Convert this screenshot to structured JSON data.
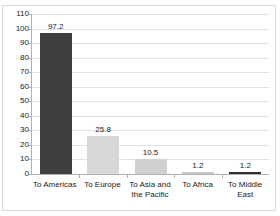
{
  "chart_data": {
    "type": "bar",
    "title": "",
    "xlabel": "",
    "ylabel": "",
    "ylim": [
      0,
      110
    ],
    "ytick_step": 10,
    "grid": true,
    "legend": "none",
    "categories": [
      "To Americas",
      "To Europe",
      "To Asia and the Pacific",
      "To Africa",
      "To Middle East"
    ],
    "values": [
      97.2,
      25.8,
      10.5,
      1.2,
      1.2
    ],
    "value_labels": [
      "97.2",
      "25.8",
      "10.5",
      "1.2",
      "1.2"
    ],
    "bar_colors": [
      "#3f3f3f",
      "#d8d8d8",
      "#d0d0d0",
      "#c8c8c8",
      "#2f2f2f"
    ],
    "ytick_labels": [
      "110",
      "100",
      "90",
      "80",
      "70",
      "60",
      "50",
      "40",
      "30",
      "20",
      "10",
      "0"
    ],
    "axis_color": "#b0b0b0",
    "grid_color": "#e2e2e2",
    "frame_color": "#d9d9d9",
    "text_color": "#1a1a1a",
    "background": "#ffffff"
  }
}
